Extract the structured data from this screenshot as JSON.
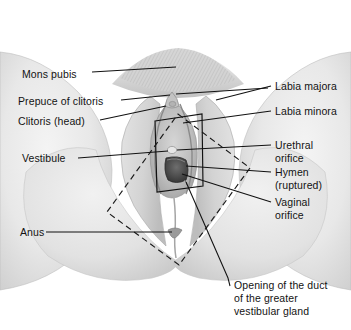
{
  "figure": {
    "style": "grayscale photographic illustration with leader-line labels",
    "background_color": "#ffffff",
    "label_text_color": "#131313",
    "leader_line_color": "#111111",
    "dashed_outline_color": "#1a1a1a",
    "solid_outline_color": "#111111"
  },
  "labels_left": [
    {
      "id": "mons-pubis",
      "text": "Mons pubis"
    },
    {
      "id": "prepuce-of-clitoris",
      "text": "Prepuce of clitoris"
    },
    {
      "id": "clitoris-head",
      "text": "Clitoris (head)"
    },
    {
      "id": "vestibule",
      "text": "Vestibule"
    },
    {
      "id": "anus",
      "text": "Anus"
    }
  ],
  "labels_right": [
    {
      "id": "labia-majora",
      "line1": "Labia majora",
      "line2": ""
    },
    {
      "id": "labia-minora",
      "line1": "Labia minora",
      "line2": ""
    },
    {
      "id": "urethral-orifice",
      "line1": "Urethral",
      "line2": "orifice"
    },
    {
      "id": "hymen-ruptured",
      "line1": "Hymen",
      "line2": "(ruptured)"
    },
    {
      "id": "vaginal-orifice",
      "line1": "Vaginal",
      "line2": "orifice"
    }
  ],
  "caption_bottom": {
    "id": "greater-vestibular-gland-duct",
    "line1": "Opening of the duct",
    "line2": "of the greater",
    "line3": "vestibular gland"
  },
  "regions": {
    "mons_pubis_hair": "stippled pubic hair mound at top center",
    "labia_majora": "paired rounded folds flanking the vestibule",
    "labia_minora": "inner folds bordering the vestibule",
    "vestibule_box": "solid-line rectangle outlining the vestibule",
    "urogenital_triangle": "dashed diamond outline spanning perineum",
    "urethral_orifice": "small pale opening above vaginal orifice",
    "vaginal_orifice": "dark oval opening below urethral orifice",
    "thighs": "large pale rounded masses at left and right",
    "buttocks": "lower rounded masses converging at bottom center"
  }
}
